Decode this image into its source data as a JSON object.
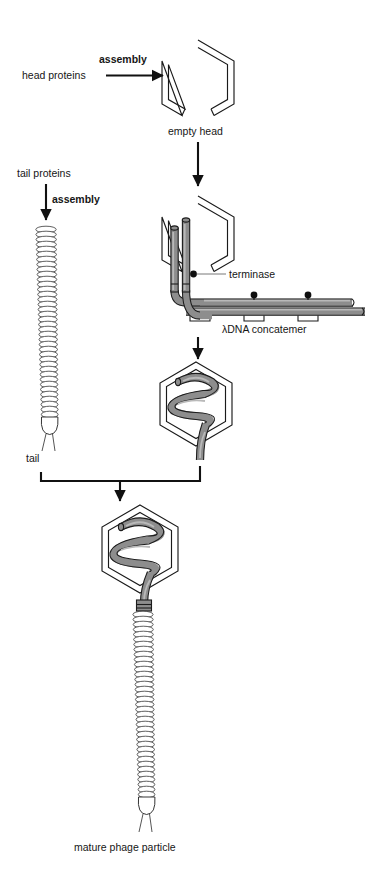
{
  "figure": {
    "background_color": "#ffffff",
    "dna_color": "#8d8d8d",
    "outline_color": "#1a1a1a"
  },
  "labels": {
    "head_proteins": "head proteins",
    "assembly_head": "assembly",
    "empty_head": "empty head",
    "tail_proteins": "tail proteins",
    "assembly_tail": "assembly",
    "tail": "tail",
    "terminase": "terminase",
    "concatemer": "λDNA concatemer",
    "mature": "mature phage particle"
  },
  "steps": [
    {
      "id": "head-assembly",
      "label": "assembly",
      "from": "head proteins",
      "to": "empty head"
    },
    {
      "id": "tail-assembly",
      "label": "assembly",
      "from": "tail proteins",
      "to": "tail"
    },
    {
      "id": "dna-packaging",
      "label": "terminase",
      "from": "empty head",
      "to": "filled head"
    },
    {
      "id": "maturation",
      "label": "",
      "from": "tail + filled head",
      "to": "mature phage particle"
    }
  ],
  "structures": {
    "empty_head": {
      "shape": "hexagon",
      "filled": false
    },
    "packaging_head": {
      "shape": "hexagon",
      "filled": false,
      "dna_entering": true
    },
    "filled_head": {
      "shape": "hexagon",
      "filled": true,
      "dna_coils": 4
    },
    "tail": {
      "shape": "striated tube",
      "rings": 40,
      "has_fibers": true
    },
    "mature_particle": {
      "head": "filled hexagon",
      "tail": "striated tube",
      "has_fibers": true
    }
  },
  "terminase_sites": 3,
  "concatemer_cut_marks": 3
}
